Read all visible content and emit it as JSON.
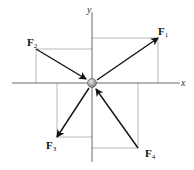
{
  "diagram": {
    "type": "force-vector-diagram",
    "axes": {
      "x_label": "x",
      "y_label": "y"
    },
    "origin": {
      "x": 92,
      "y": 83
    },
    "forces": [
      {
        "name": "F",
        "sub": "1",
        "from": [
          92,
          83
        ],
        "to": [
          158,
          38
        ],
        "direction": "outward"
      },
      {
        "name": "F",
        "sub": "2",
        "from": [
          36,
          49
        ],
        "to": [
          92,
          83
        ],
        "direction": "inward"
      },
      {
        "name": "F",
        "sub": "3",
        "from": [
          92,
          83
        ],
        "to": [
          57,
          137
        ],
        "direction": "outward"
      },
      {
        "name": "F",
        "sub": "4",
        "from": [
          138,
          148
        ],
        "to": [
          92,
          83
        ],
        "direction": "inward"
      }
    ],
    "colors": {
      "vector": "#111111",
      "axis": "#444444",
      "guide": "#9a9a9a",
      "particle": "#9c9c9c"
    }
  }
}
